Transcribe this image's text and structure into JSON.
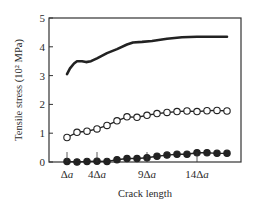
{
  "chart_data": {
    "type": "line",
    "title": "",
    "xlabel": "Crack length",
    "ylabel": "Tensile stress (10² MPa)",
    "ylim": [
      0,
      5
    ],
    "yticks": [
      0,
      1,
      2,
      3,
      4,
      5
    ],
    "x_tick_labels": [
      {
        "pos": 1,
        "label": "Δa"
      },
      {
        "pos": 4,
        "label": "4Δa"
      },
      {
        "pos": 9,
        "label": "9Δa"
      },
      {
        "pos": 14,
        "label": "14Δa"
      }
    ],
    "xlim": [
      -0.8,
      18.4
    ],
    "grid": false,
    "legend": null,
    "series": [
      {
        "name": "upper curve (solid line, no markers)",
        "marker": "none",
        "x": [
          1,
          1.3,
          1.7,
          2,
          2.5,
          2.9,
          3.4,
          4,
          5,
          6,
          7,
          7.6,
          8.5,
          9.5,
          11,
          12.5,
          14,
          15.5,
          17
        ],
        "values": [
          3.05,
          3.25,
          3.42,
          3.5,
          3.5,
          3.47,
          3.5,
          3.6,
          3.78,
          3.92,
          4.08,
          4.15,
          4.17,
          4.2,
          4.28,
          4.33,
          4.35,
          4.35,
          4.35
        ]
      },
      {
        "name": "middle curve (open circles)",
        "marker": "open-circle",
        "x": [
          1,
          2,
          3,
          4,
          5,
          6,
          7,
          8,
          9,
          10,
          11,
          12,
          13,
          14,
          15,
          16,
          17
        ],
        "values": [
          0.85,
          1.03,
          1.07,
          1.15,
          1.27,
          1.43,
          1.57,
          1.55,
          1.62,
          1.68,
          1.72,
          1.75,
          1.77,
          1.75,
          1.78,
          1.79,
          1.77
        ]
      },
      {
        "name": "lower curve (filled circles)",
        "marker": "filled-circle",
        "x": [
          1,
          2,
          3,
          4,
          5,
          6,
          7,
          8,
          9,
          10,
          11,
          12,
          13,
          14,
          15,
          16,
          17
        ],
        "values": [
          0.02,
          0.0,
          0.02,
          0.03,
          0.02,
          0.08,
          0.12,
          0.12,
          0.15,
          0.2,
          0.24,
          0.27,
          0.27,
          0.32,
          0.32,
          0.3,
          0.3
        ]
      }
    ]
  }
}
